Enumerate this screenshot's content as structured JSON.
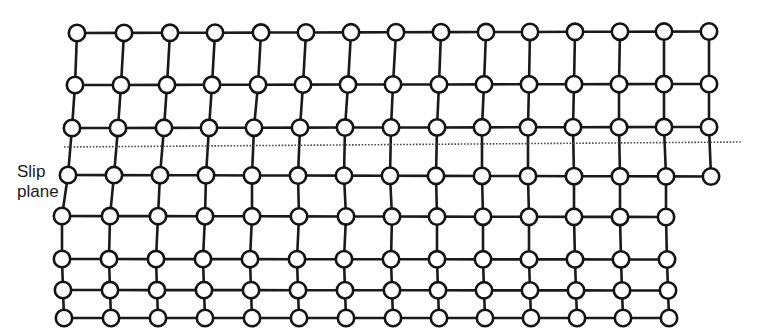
{
  "figure": {
    "background_color": "#ffffff",
    "line_color": "#1a1a1a",
    "atom_fill": "#ffffff",
    "atom_stroke": "#141414",
    "slip_plane_color": "#4d4d4d",
    "bond_width": 2.6,
    "atom_radius": 8.2,
    "atom_stroke_width": 2.6
  },
  "labels": {
    "slip_line1": "Slip",
    "slip_line2": "plane"
  },
  "slip_plane": {
    "style": "dotted",
    "x_start": 64,
    "x_end": 742,
    "y_left": 147,
    "y_right": 142,
    "dash": "1.6 1.6",
    "width": 1.6
  },
  "lattice": {
    "description": "8 rows; rows 1-4 (above slip plane) have 15 atoms, rows 5-8 (below slip plane) have 14 atoms, producing an extra half-plane / edge dislocation that has slipped to the right",
    "rows_above": 4,
    "rows_below": 4,
    "cols_above": 15,
    "cols_below": 14,
    "row_y": [
      33,
      85,
      128,
      175,
      216,
      259,
      290,
      318
    ],
    "rows": [
      {
        "id": "row-1",
        "y": 33,
        "x": [
          77,
          124,
          170,
          215,
          261,
          306,
          351,
          396,
          441,
          486,
          530,
          575,
          620,
          664,
          709
        ]
      },
      {
        "id": "row-2",
        "y": 85,
        "x": [
          75,
          121,
          167,
          212,
          258,
          303,
          348,
          393,
          439,
          484,
          529,
          574,
          619,
          664,
          709
        ]
      },
      {
        "id": "row-3",
        "y": 128,
        "x": [
          72,
          118,
          164,
          209,
          254,
          300,
          345,
          391,
          437,
          482,
          528,
          573,
          619,
          664,
          709
        ]
      },
      {
        "id": "row-4",
        "y": 175,
        "x": [
          68,
          114,
          160,
          206,
          252,
          298,
          344,
          390,
          436,
          482,
          528,
          574,
          620,
          666,
          711
        ]
      },
      {
        "id": "row-5",
        "y": 216,
        "x": [
          62,
          110,
          158,
          205,
          252,
          299,
          346,
          392,
          437,
          483,
          529,
          574,
          620,
          666
        ]
      },
      {
        "id": "row-6",
        "y": 259,
        "x": [
          62,
          109,
          156,
          203,
          250,
          297,
          344,
          391,
          437,
          483,
          529,
          575,
          621,
          667
        ]
      },
      {
        "id": "row-7",
        "y": 290,
        "x": [
          63,
          110,
          157,
          204,
          251,
          298,
          345,
          392,
          438,
          484,
          530,
          576,
          622,
          668
        ]
      },
      {
        "id": "row-8",
        "y": 318,
        "x": [
          64,
          111,
          158,
          205,
          252,
          299,
          346,
          393,
          439,
          485,
          531,
          577,
          623,
          669
        ]
      }
    ],
    "vertical_bonds": [
      {
        "from_row": 0,
        "to_row": 1,
        "pairs": [
          [
            0,
            0
          ],
          [
            1,
            1
          ],
          [
            2,
            2
          ],
          [
            3,
            3
          ],
          [
            4,
            4
          ],
          [
            5,
            5
          ],
          [
            6,
            6
          ],
          [
            7,
            7
          ],
          [
            8,
            8
          ],
          [
            9,
            9
          ],
          [
            10,
            10
          ],
          [
            11,
            11
          ],
          [
            12,
            12
          ],
          [
            13,
            13
          ],
          [
            14,
            14
          ]
        ]
      },
      {
        "from_row": 1,
        "to_row": 2,
        "pairs": [
          [
            0,
            0
          ],
          [
            1,
            1
          ],
          [
            2,
            2
          ],
          [
            3,
            3
          ],
          [
            4,
            4
          ],
          [
            5,
            5
          ],
          [
            6,
            6
          ],
          [
            7,
            7
          ],
          [
            8,
            8
          ],
          [
            9,
            9
          ],
          [
            10,
            10
          ],
          [
            11,
            11
          ],
          [
            12,
            12
          ],
          [
            13,
            13
          ],
          [
            14,
            14
          ]
        ]
      },
      {
        "from_row": 2,
        "to_row": 3,
        "pairs": [
          [
            0,
            0
          ],
          [
            1,
            1
          ],
          [
            2,
            2
          ],
          [
            3,
            3
          ],
          [
            4,
            4
          ],
          [
            5,
            5
          ],
          [
            6,
            6
          ],
          [
            7,
            7
          ],
          [
            8,
            8
          ],
          [
            9,
            9
          ],
          [
            10,
            10
          ],
          [
            11,
            11
          ],
          [
            12,
            12
          ],
          [
            13,
            13
          ],
          [
            14,
            14
          ]
        ]
      },
      {
        "from_row": 3,
        "to_row": 4,
        "pairs": [
          [
            0,
            0
          ],
          [
            1,
            1
          ],
          [
            2,
            2
          ],
          [
            3,
            3
          ],
          [
            4,
            4
          ],
          [
            5,
            5
          ],
          [
            6,
            6
          ],
          [
            7,
            7
          ],
          [
            8,
            8
          ],
          [
            9,
            9
          ],
          [
            10,
            10
          ],
          [
            11,
            11
          ],
          [
            12,
            12
          ],
          [
            13,
            13
          ]
        ]
      },
      {
        "from_row": 4,
        "to_row": 5,
        "pairs": [
          [
            0,
            0
          ],
          [
            1,
            1
          ],
          [
            2,
            2
          ],
          [
            3,
            3
          ],
          [
            4,
            4
          ],
          [
            5,
            5
          ],
          [
            6,
            6
          ],
          [
            7,
            7
          ],
          [
            8,
            8
          ],
          [
            9,
            9
          ],
          [
            10,
            10
          ],
          [
            11,
            11
          ],
          [
            12,
            12
          ],
          [
            13,
            13
          ]
        ]
      },
      {
        "from_row": 5,
        "to_row": 6,
        "pairs": [
          [
            0,
            0
          ],
          [
            1,
            1
          ],
          [
            2,
            2
          ],
          [
            3,
            3
          ],
          [
            4,
            4
          ],
          [
            5,
            5
          ],
          [
            6,
            6
          ],
          [
            7,
            7
          ],
          [
            8,
            8
          ],
          [
            9,
            9
          ],
          [
            10,
            10
          ],
          [
            11,
            11
          ],
          [
            12,
            12
          ],
          [
            13,
            13
          ]
        ]
      },
      {
        "from_row": 6,
        "to_row": 7,
        "pairs": [
          [
            0,
            0
          ],
          [
            1,
            1
          ],
          [
            2,
            2
          ],
          [
            3,
            3
          ],
          [
            4,
            4
          ],
          [
            5,
            5
          ],
          [
            6,
            6
          ],
          [
            7,
            7
          ],
          [
            8,
            8
          ],
          [
            9,
            9
          ],
          [
            10,
            10
          ],
          [
            11,
            11
          ],
          [
            12,
            12
          ],
          [
            13,
            13
          ]
        ]
      }
    ]
  }
}
